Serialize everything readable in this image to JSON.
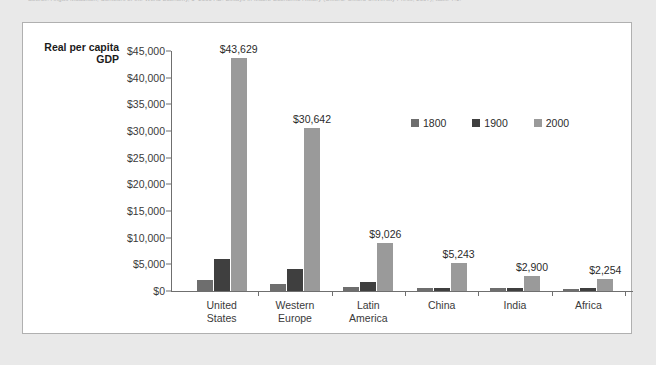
{
  "source_caption": "Source: Angus Maddison, Contours of the World Economy, 1–2030 AD: Essays in Macro-Economic History (Oxford: Oxford University Press, 2007), table 7.1.",
  "chart_data": {
    "type": "bar",
    "title": "",
    "ylabel": "Real per capita GDP",
    "xlabel": "",
    "ylim": [
      0,
      45000
    ],
    "ytick_labels": [
      "$0",
      "$5,000",
      "$10,000",
      "$15,000",
      "$20,000",
      "$25,000",
      "$30,000",
      "$35,000",
      "$40,000",
      "$45,000"
    ],
    "ytick_values": [
      0,
      5000,
      10000,
      15000,
      20000,
      25000,
      30000,
      35000,
      40000,
      45000
    ],
    "grid": false,
    "legend_position": "upper right inside plot",
    "categories": [
      "United\nStates",
      "Western\nEurope",
      "Latin\nAmerica",
      "China",
      "India",
      "Africa"
    ],
    "series": [
      {
        "name": "1800",
        "color": "#6e6e6e",
        "values": [
          2000,
          1300,
          800,
          600,
          550,
          450
        ]
      },
      {
        "name": "1900",
        "color": "#3f3f3f",
        "values": [
          6000,
          4100,
          1600,
          650,
          650,
          650
        ]
      },
      {
        "name": "2000",
        "color": "#9a9a9a",
        "values": [
          43629,
          30642,
          9026,
          5243,
          2900,
          2254
        ]
      }
    ],
    "value_labels_2000": [
      "$43,629",
      "$30,642",
      "$9,026",
      "$5,243",
      "$2,900",
      "$2,254"
    ]
  }
}
